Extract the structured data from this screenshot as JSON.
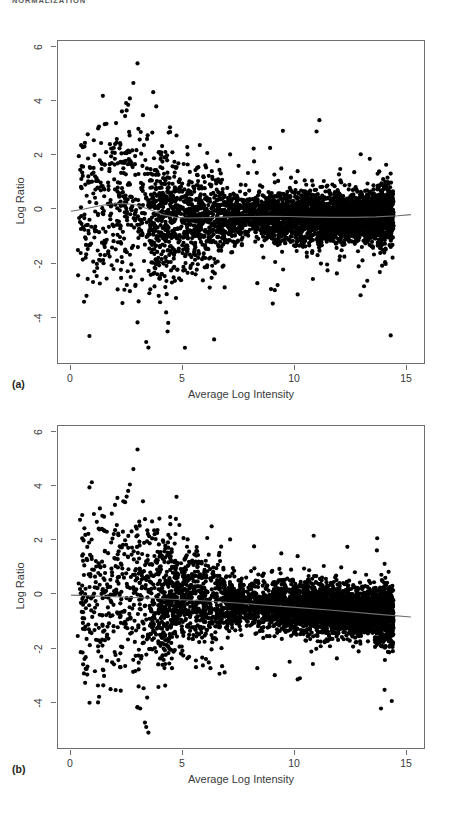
{
  "running_head": "NORMALIZATION",
  "figure": {
    "panels": [
      {
        "id": "a",
        "label": "(a)",
        "xlabel": "Average Log Intensity",
        "ylabel": "Log Ratio",
        "xticks": [
          "0",
          "5",
          "10",
          "15"
        ],
        "yticks": [
          "6",
          "4",
          "2",
          "0",
          "-2",
          "-4"
        ]
      },
      {
        "id": "b",
        "label": "(b)",
        "xlabel": "Average Log Intensity",
        "ylabel": "Log Ratio",
        "xticks": [
          "0",
          "5",
          "10",
          "15"
        ],
        "yticks": [
          "6",
          "4",
          "2",
          "0",
          "-2",
          "-4"
        ]
      }
    ]
  },
  "chart_data": [
    {
      "type": "scatter",
      "id": "panel-a",
      "title": "",
      "subtitle": "(a) MA plot before normalization",
      "xlabel": "Average Log Intensity",
      "ylabel": "Log Ratio",
      "xlim": [
        -0.6,
        16.2
      ],
      "ylim": [
        -4.9,
        6.6
      ],
      "xticks": [
        0,
        5,
        10,
        15
      ],
      "yticks": [
        -4,
        -2,
        0,
        2,
        4,
        6
      ],
      "grid": false,
      "legend": null,
      "point_color": "#000000",
      "point_size": 2.1,
      "n_points": 4200,
      "series": [
        {
          "name": "lowess-fit",
          "type": "line",
          "color": "#6f6f71",
          "x": [
            0.0,
            0.6,
            1.2,
            1.8,
            2.4,
            3.0,
            3.6,
            4.2,
            4.8,
            5.4,
            6.0,
            7.0,
            8.0,
            9.0,
            10.0,
            11.0,
            12.0,
            13.0,
            14.0,
            15.0,
            15.6
          ],
          "y": [
            0.52,
            0.6,
            0.7,
            0.78,
            0.8,
            0.74,
            0.58,
            0.4,
            0.3,
            0.28,
            0.29,
            0.31,
            0.33,
            0.34,
            0.33,
            0.31,
            0.3,
            0.3,
            0.32,
            0.36,
            0.4
          ]
        }
      ],
      "density_description": "Dense horizontal cloud centred near Log Ratio 0.3 spanning Average Log Intensity 6 to 15, with a sparse fan of outliers from 0 to 6 and a diagonal streak of isolated points rising to Log Ratio 6 near intensity 2-3."
    },
    {
      "type": "scatter",
      "id": "panel-b",
      "title": "",
      "subtitle": "(b) MA plot after normalization",
      "xlabel": "Average Log Intensity",
      "ylabel": "Log Ratio",
      "xlim": [
        -0.6,
        16.2
      ],
      "ylim": [
        -4.9,
        6.6
      ],
      "xticks": [
        0,
        5,
        10,
        15
      ],
      "yticks": [
        -4,
        -2,
        0,
        2,
        4,
        6
      ],
      "grid": false,
      "legend": null,
      "point_color": "#000000",
      "point_size": 2.1,
      "n_points": 4200,
      "series": [
        {
          "name": "fitted-line",
          "type": "line",
          "color": "#6f6f71",
          "x": [
            0.0,
            2.0,
            4.0,
            6.0,
            8.0,
            10.0,
            12.0,
            14.0,
            15.6
          ],
          "y": [
            0.56,
            0.5,
            0.44,
            0.36,
            0.26,
            0.14,
            0.02,
            -0.12,
            -0.22
          ]
        }
      ],
      "density_description": "Dense horizontal cloud centred near Log Ratio 0.1 spanning Average Log Intensity 5 to 15, sparse outlier fan at low intensity and the same diagonal streak of isolated points reaching Log Ratio 6."
    }
  ]
}
